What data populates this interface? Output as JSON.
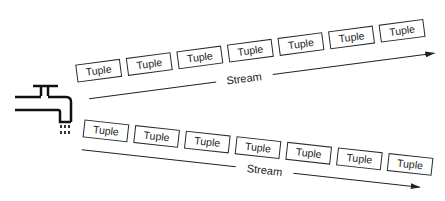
{
  "diagram": {
    "source": {
      "icon": "faucet-icon"
    },
    "streams": [
      {
        "label": "Stream",
        "direction": "up-right",
        "tuples": [
          "Tuple",
          "Tuple",
          "Tuple",
          "Tuple",
          "Tuple",
          "Tuple",
          "Tuple"
        ]
      },
      {
        "label": "Stream",
        "direction": "down-right",
        "tuples": [
          "Tuple",
          "Tuple",
          "Tuple",
          "Tuple",
          "Tuple",
          "Tuple",
          "Tuple"
        ]
      }
    ]
  },
  "colors": {
    "stroke": "#222222",
    "background": "#ffffff"
  }
}
